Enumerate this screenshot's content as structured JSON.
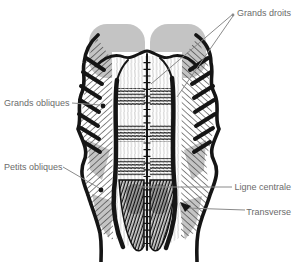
{
  "figure": {
    "labels": {
      "grands_droits": "Grands droits",
      "grands_obliques": "Grands obliques",
      "petits_obliques": "Petits obliques",
      "ligne_centrale": "Ligne centrale",
      "transverse": "Transverse"
    },
    "colors": {
      "label_text": "#6b6b6b",
      "leader_line": "#8a8a8a",
      "ink": "#151515",
      "shading_gray": "#c4c4c4",
      "background": "#ffffff"
    }
  }
}
